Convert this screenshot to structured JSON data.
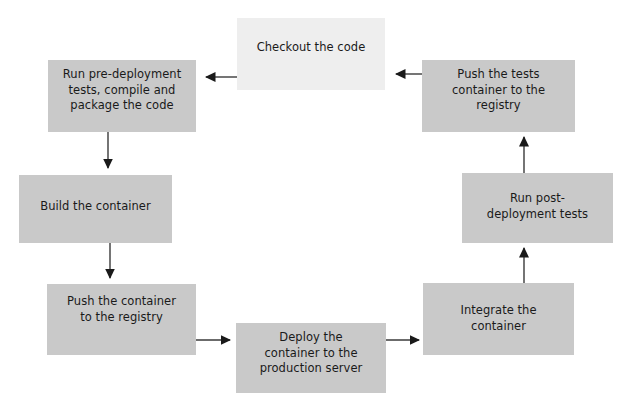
{
  "diagram": {
    "type": "cycle-flowchart",
    "background_color": "#ffffff",
    "node_fill_color": "#c9c9c9",
    "highlight_node_fill_color": "#eeeeee",
    "arrow_color": "#1a1a1a",
    "text_color": "#1a1a1a",
    "nodes": [
      {
        "id": "checkout",
        "label": "Checkout the code",
        "style": "light"
      },
      {
        "id": "predeploy",
        "label": "Run pre-deployment\ntests, compile and\npackage the code",
        "style": "default"
      },
      {
        "id": "build",
        "label": "Build the container",
        "style": "default"
      },
      {
        "id": "pushcontainer",
        "label": "Push the container\nto the registry",
        "style": "default"
      },
      {
        "id": "deploy",
        "label": "Deploy the\ncontainer to the\nproduction server",
        "style": "default"
      },
      {
        "id": "integrate",
        "label": "Integrate the\ncontainer",
        "style": "default"
      },
      {
        "id": "postdeploy",
        "label": "Run post-\ndeployment tests",
        "style": "default"
      },
      {
        "id": "pushtests",
        "label": "Push the tests\ncontainer to the\nregistry",
        "style": "default"
      }
    ],
    "edges": [
      {
        "from": "checkout",
        "to": "predeploy",
        "direction": "left"
      },
      {
        "from": "predeploy",
        "to": "build",
        "direction": "down"
      },
      {
        "from": "build",
        "to": "pushcontainer",
        "direction": "down"
      },
      {
        "from": "pushcontainer",
        "to": "deploy",
        "direction": "right"
      },
      {
        "from": "deploy",
        "to": "integrate",
        "direction": "right"
      },
      {
        "from": "integrate",
        "to": "postdeploy",
        "direction": "up"
      },
      {
        "from": "postdeploy",
        "to": "pushtests",
        "direction": "up"
      },
      {
        "from": "pushtests",
        "to": "checkout",
        "direction": "left"
      }
    ]
  }
}
